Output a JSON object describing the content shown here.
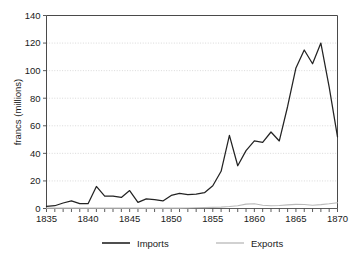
{
  "chart_data": {
    "type": "line",
    "title": "",
    "xlabel": "",
    "ylabel": "francs (millions)",
    "xlim": [
      1835,
      1870
    ],
    "ylim": [
      0,
      140
    ],
    "ytick_step": 20,
    "xtick_step": 1,
    "xlabel_step": 5,
    "grid": true,
    "grid_axis": "y",
    "legend_position": "bottom",
    "yticks": [
      0,
      20,
      40,
      60,
      80,
      100,
      120,
      140
    ],
    "ytick_labels": [
      "0",
      "20",
      "40",
      "60",
      "80",
      "100",
      "120",
      "140"
    ],
    "xticks": [
      1835,
      1836,
      1837,
      1838,
      1839,
      1840,
      1841,
      1842,
      1843,
      1844,
      1845,
      1846,
      1847,
      1848,
      1849,
      1850,
      1851,
      1852,
      1853,
      1854,
      1855,
      1856,
      1857,
      1858,
      1859,
      1860,
      1861,
      1862,
      1863,
      1864,
      1865,
      1866,
      1867,
      1868,
      1869,
      1870
    ],
    "xtick_labels": [
      "1835",
      "1840",
      "1845",
      "1850",
      "1855",
      "1860",
      "1865",
      "1870"
    ],
    "x": [
      1835,
      1836,
      1837,
      1838,
      1839,
      1840,
      1841,
      1842,
      1843,
      1844,
      1845,
      1846,
      1847,
      1848,
      1849,
      1850,
      1851,
      1852,
      1853,
      1854,
      1855,
      1856,
      1857,
      1858,
      1859,
      1860,
      1861,
      1862,
      1863,
      1864,
      1865,
      1866,
      1867,
      1868,
      1869,
      1870
    ],
    "series": [
      {
        "name": "Imports",
        "color": "#232323",
        "values": [
          1.5,
          2.0,
          4.0,
          5.5,
          3.5,
          3.5,
          16.0,
          9.0,
          9.0,
          8.0,
          13.0,
          4.5,
          7.0,
          6.5,
          5.5,
          9.5,
          11.0,
          10.0,
          10.5,
          11.5,
          16.5,
          27.0,
          53.0,
          31.0,
          42.0,
          49.0,
          48.0,
          55.5,
          49.0,
          74.0,
          102.0,
          115.0,
          105.0,
          120.0,
          88.0,
          52.0
        ]
      },
      {
        "name": "Exports",
        "color": "#b9b9b9",
        "values": [
          0.3,
          0.3,
          0.3,
          0.3,
          0.3,
          0.3,
          0.3,
          0.3,
          0.3,
          0.3,
          0.3,
          0.3,
          0.3,
          0.3,
          0.3,
          0.3,
          0.3,
          0.4,
          0.5,
          0.6,
          0.8,
          1.0,
          1.4,
          2.0,
          3.2,
          3.4,
          2.4,
          2.0,
          2.2,
          2.6,
          3.0,
          2.9,
          2.4,
          2.8,
          3.4,
          4.2
        ]
      }
    ],
    "legend": [
      {
        "label": "Imports",
        "color": "#232323"
      },
      {
        "label": "Exports",
        "color": "#b9b9b9"
      }
    ]
  }
}
